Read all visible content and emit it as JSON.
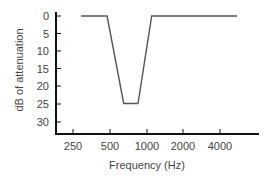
{
  "chart_data": {
    "type": "line",
    "title": "",
    "xlabel": "Frequency (Hz)",
    "ylabel": "dB of attenuation",
    "x_scale": "log2",
    "x_ticks": [
      250,
      500,
      1000,
      2000,
      4000
    ],
    "x_tick_labels": [
      "250",
      "500",
      "1000",
      "2000",
      "4000"
    ],
    "y_ticks": [
      0,
      5,
      10,
      15,
      20,
      25,
      30
    ],
    "y_tick_labels": [
      "0",
      "5",
      "10",
      "15",
      "20",
      "25",
      "30"
    ],
    "y_inverted": true,
    "ylim": [
      0,
      33
    ],
    "xlim": [
      200,
      8000
    ],
    "grid": false,
    "legend": null,
    "series": [
      {
        "name": "attenuation",
        "x": [
          290,
          475,
          650,
          850,
          1100,
          5500
        ],
        "y": [
          0,
          0,
          25,
          25,
          0,
          0
        ]
      }
    ]
  },
  "labels": {
    "xlabel": "Frequency (Hz)",
    "ylabel": "dB of attenuation",
    "y_ticks": [
      "0",
      "5",
      "10",
      "15",
      "20",
      "25",
      "30"
    ],
    "x_ticks": [
      "250",
      "500",
      "1000",
      "2000",
      "4000"
    ]
  }
}
